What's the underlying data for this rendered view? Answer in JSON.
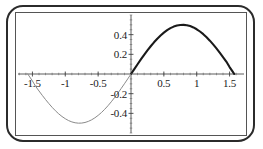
{
  "figure": {
    "name": "plot-odd-trig-function",
    "frame_color": "#2b2b2b",
    "plot_frame_color": "#555555",
    "axis_color": "#4a4a4a",
    "curve_positive_color": "#1a1a1a",
    "curve_negative_color": "#8a8a8a"
  },
  "chart_data": {
    "type": "line",
    "title": "",
    "xlabel": "",
    "ylabel": "",
    "xlim": [
      -1.75,
      1.75
    ],
    "ylim": [
      -0.62,
      0.62
    ],
    "grid": false,
    "legend": null,
    "x_ticks": [
      -1.5,
      -1,
      -0.5,
      0.5,
      1,
      1.5
    ],
    "x_tick_labels": [
      "-1.5",
      "-1",
      "-0.5",
      "0.5",
      "1",
      "1.5"
    ],
    "y_ticks": [
      0.4,
      0.2,
      -0.2,
      -0.4
    ],
    "y_tick_labels": [
      "0.4",
      "0.2",
      "-0.2",
      "-0.4"
    ],
    "minor_ticks": true,
    "series": [
      {
        "name": "branch-positive",
        "style": "thick",
        "color": "#1a1a1a",
        "x": [
          0,
          0.05,
          0.1,
          0.15,
          0.2,
          0.25,
          0.3,
          0.35,
          0.4,
          0.45,
          0.5,
          0.55,
          0.6,
          0.65,
          0.7,
          0.75,
          0.8,
          0.85,
          0.9,
          0.95,
          1.0,
          1.05,
          1.1,
          1.15,
          1.2,
          1.25,
          1.3,
          1.35,
          1.4,
          1.45,
          1.5,
          1.55,
          1.5708
        ],
        "y": [
          0,
          0.0499,
          0.0993,
          0.1478,
          0.1947,
          0.2397,
          0.2823,
          0.3221,
          0.3587,
          0.3919,
          0.4207,
          0.4455,
          0.466,
          0.4818,
          0.4927,
          0.4987,
          0.4997,
          0.4958,
          0.487,
          0.4735,
          0.4546,
          0.432,
          0.4048,
          0.3736,
          0.3387,
          0.3007,
          0.26,
          0.2171,
          0.1726,
          0.1269,
          0.0706,
          0.0208,
          0.0
        ]
      },
      {
        "name": "branch-negative",
        "style": "thin",
        "color": "#8a8a8a",
        "x": [
          -1.5708,
          -1.55,
          -1.5,
          -1.45,
          -1.4,
          -1.35,
          -1.3,
          -1.25,
          -1.2,
          -1.15,
          -1.1,
          -1.05,
          -1.0,
          -0.95,
          -0.9,
          -0.85,
          -0.8,
          -0.75,
          -0.7,
          -0.65,
          -0.6,
          -0.55,
          -0.5,
          -0.45,
          -0.4,
          -0.35,
          -0.3,
          -0.25,
          -0.2,
          -0.15,
          -0.1,
          -0.05,
          0
        ],
        "y": [
          0.0,
          -0.0208,
          -0.0706,
          -0.1269,
          -0.1726,
          -0.2171,
          -0.26,
          -0.3007,
          -0.3387,
          -0.3736,
          -0.4048,
          -0.432,
          -0.4546,
          -0.4735,
          -0.487,
          -0.4958,
          -0.4997,
          -0.4987,
          -0.4927,
          -0.4818,
          -0.466,
          -0.4455,
          -0.4207,
          -0.3919,
          -0.3587,
          -0.3221,
          -0.2823,
          -0.2397,
          -0.1947,
          -0.1478,
          -0.0993,
          -0.0499,
          0
        ]
      }
    ]
  }
}
